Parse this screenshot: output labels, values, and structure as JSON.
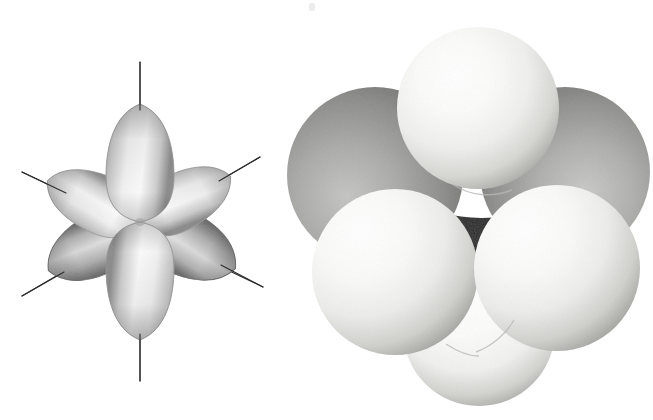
{
  "figure": {
    "background_color": "#ffffff",
    "width": 653,
    "height": 420,
    "style": "halftone grayscale textbook illustration"
  },
  "panels": [
    {
      "id": "orbital-diagram",
      "name": "six-lobed hybrid orbital diagram",
      "description": "Six teardrop shaped orbital lobes radiating from a common center, each pierced by a thin straight axis line",
      "center": {
        "x": 140,
        "y": 222
      },
      "lobe_count": 6,
      "axis_line_count": 3,
      "axis_line_color": "#2a2a2a",
      "axis_line_width": 1.1,
      "lobe_fill_light": "#fdfdfd",
      "lobe_fill_mid": "#c9c9c9",
      "lobe_fill_dark": "#6d6d6d",
      "lobe_outline": "#8a8a8a",
      "lobes": [
        {
          "label": "up",
          "angle_deg": -90,
          "length": 120,
          "width": 48,
          "shade": "light"
        },
        {
          "label": "down",
          "angle_deg": 90,
          "length": 120,
          "width": 48,
          "shade": "light"
        },
        {
          "label": "upper-left",
          "angle_deg": -156,
          "length": 100,
          "width": 42,
          "shade": "light"
        },
        {
          "label": "upper-right",
          "angle_deg": -27,
          "length": 100,
          "width": 40,
          "shade": "light"
        },
        {
          "label": "lower-left",
          "angle_deg": 152,
          "length": 104,
          "width": 44,
          "shade": "dark"
        },
        {
          "label": "lower-right",
          "angle_deg": 26,
          "length": 108,
          "width": 44,
          "shade": "dark"
        }
      ],
      "axes": [
        {
          "label": "vertical-axis",
          "x1": 140,
          "y1": 62,
          "x2": 140,
          "y2": 381
        },
        {
          "label": "diagonal-axis-nw-se",
          "x1": 22,
          "y1": 172,
          "x2": 263,
          "y2": 287
        },
        {
          "label": "diagonal-axis-sw-ne",
          "x1": 22,
          "y1": 296,
          "x2": 260,
          "y2": 157
        }
      ]
    },
    {
      "id": "space-filling-model",
      "name": "space-filling molecular model",
      "description": "Five large pale spheres clustered in tetrahedral arrangement around a dark central atom, with two darker grey spheres partially hidden behind",
      "sphere_light_highlight": "#ffffff",
      "sphere_light_base": "#e8e8e6",
      "sphere_light_shadow": "#a9a9a7",
      "sphere_dark_highlight": "#b4b4b2",
      "sphere_dark_base": "#8d8d8b",
      "sphere_dark_shadow": "#4f4f4e",
      "core_color": "#191919",
      "spheres": [
        {
          "label": "back-left-sphere",
          "cx": 375,
          "cy": 175,
          "r": 88,
          "tone": "dark",
          "layer": 0
        },
        {
          "label": "back-right-sphere",
          "cx": 565,
          "cy": 172,
          "r": 85,
          "tone": "dark",
          "layer": 0
        },
        {
          "label": "top-sphere",
          "cx": 478,
          "cy": 108,
          "r": 81,
          "tone": "light",
          "layer": 2
        },
        {
          "label": "front-left-sphere",
          "cx": 395,
          "cy": 272,
          "r": 83,
          "tone": "light",
          "layer": 2
        },
        {
          "label": "front-right-sphere",
          "cx": 557,
          "cy": 268,
          "r": 83,
          "tone": "light",
          "layer": 2
        },
        {
          "label": "bottom-sphere",
          "cx": 479,
          "cy": 330,
          "r": 76,
          "tone": "light",
          "layer": 1
        }
      ],
      "core": {
        "label": "central-dark-atom",
        "cx": 477,
        "cy": 232,
        "r": 62
      }
    }
  ],
  "artifacts": [
    {
      "label": "dust-speck",
      "x": 310,
      "y": 4,
      "color": "#ececec"
    }
  ]
}
